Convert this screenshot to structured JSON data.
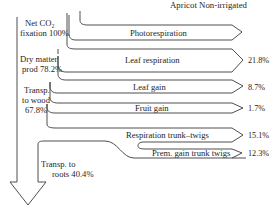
{
  "title": "Apricot Non-irrigated",
  "left_labels": {
    "net_co2": [
      "Net CO₂",
      "fixation 100%"
    ],
    "dry_matter": [
      "Dry matter",
      "prod 78.2%"
    ],
    "transp_wood": [
      "Transp.",
      "to wood",
      "67.8%"
    ],
    "transp_roots": [
      "Transp. to",
      "roots 40.4%"
    ]
  },
  "flows": [
    {
      "name": "Photorespiration",
      "value": ""
    },
    {
      "name": "Leaf respiration",
      "value": "21.8%"
    },
    {
      "name": "Leaf gain",
      "value": "8.7%"
    },
    {
      "name": "Fruit gain",
      "value": "1.7%"
    },
    {
      "name": "Respiration trunk–twigs",
      "value": "15.1%"
    },
    {
      "name": "Prem. gain trunk twigs",
      "value": "12.3%"
    }
  ],
  "stock_values": {
    "net_co2_fixation_pct": 100,
    "dry_matter_prod_pct": 78.2,
    "transp_to_wood_pct": 67.8,
    "transp_to_roots_pct": 40.4
  }
}
